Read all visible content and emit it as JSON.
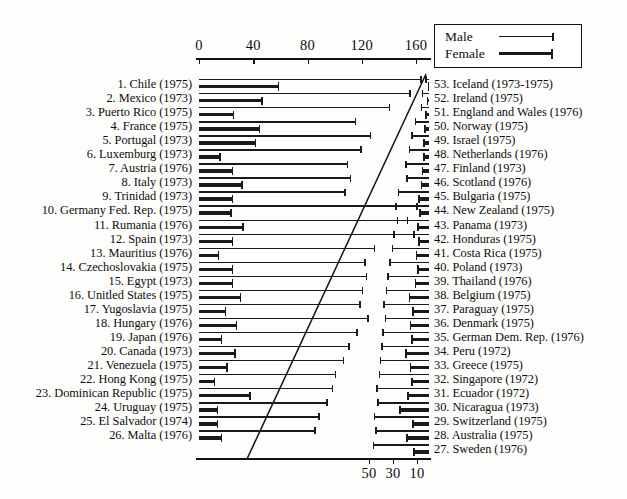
{
  "legend": {
    "male_label": "Male",
    "female_label": "Female"
  },
  "axes": {
    "top": {
      "ticks": [
        "0",
        "40",
        "80",
        "120",
        "160"
      ],
      "values": [
        0,
        40,
        80,
        120,
        160
      ]
    },
    "bottom": {
      "ticks": [
        "50",
        "30",
        "10"
      ],
      "values": [
        50,
        30,
        10
      ],
      "reversed": true
    }
  },
  "chart_data": {
    "type": "bar",
    "title": "",
    "xlabel": "",
    "ylabel": "",
    "orientation": "horizontal",
    "series_names": [
      "Male",
      "Female"
    ],
    "top_axis_range": [
      0,
      170
    ],
    "bottom_axis_range": [
      0,
      55
    ],
    "left_panel": {
      "axis": "top",
      "rows": [
        {
          "rank": 1,
          "label": "1. Chile (1975)",
          "male": 163,
          "female": 58
        },
        {
          "rank": 2,
          "label": "2. Mexico (1973)",
          "male": 155,
          "female": 46
        },
        {
          "rank": 3,
          "label": "3. Puerto Rico (1975)",
          "male": 140,
          "female": 25
        },
        {
          "rank": 4,
          "label": "4. France (1975)",
          "male": 115,
          "female": 44
        },
        {
          "rank": 5,
          "label": "5. Portugal (1973)",
          "male": 126,
          "female": 41
        },
        {
          "rank": 6,
          "label": "6. Luxemburg (1973)",
          "male": 119,
          "female": 15
        },
        {
          "rank": 7,
          "label": "7. Austria (1976)",
          "male": 109,
          "female": 24
        },
        {
          "rank": 8,
          "label": "8. Italy (1973)",
          "male": 111,
          "female": 31
        },
        {
          "rank": 9,
          "label": "9. Trinidad (1973)",
          "male": 107,
          "female": 24
        },
        {
          "rank": 10,
          "label": "10. Germany Fed. Rep. (1975)",
          "male": 160,
          "female": 23
        },
        {
          "rank": 11,
          "label": "11. Rumania (1976)",
          "male": 153,
          "female": 32
        },
        {
          "rank": 12,
          "label": "12. Spain (1973)",
          "male": 158,
          "female": 24
        },
        {
          "rank": 13,
          "label": "13. Mauritius (1976)",
          "male": 129,
          "female": 14
        },
        {
          "rank": 14,
          "label": "14. Czechoslovakia (1975)",
          "male": 122,
          "female": 24
        },
        {
          "rank": 15,
          "label": "15. Egypt (1973)",
          "male": 123,
          "female": 24
        },
        {
          "rank": 16,
          "label": "16. Unitled States (1975)",
          "male": 120,
          "female": 30
        },
        {
          "rank": 17,
          "label": "17. Yugoslavia (1975)",
          "male": 118,
          "female": 19
        },
        {
          "rank": 18,
          "label": "18. Hungary (1976)",
          "male": 124,
          "female": 27
        },
        {
          "rank": 19,
          "label": "19. Japan (1976)",
          "male": 116,
          "female": 16
        },
        {
          "rank": 20,
          "label": "20. Canada (1973)",
          "male": 110,
          "female": 26
        },
        {
          "rank": 21,
          "label": "21. Venezuela (1975)",
          "male": 106,
          "female": 20
        },
        {
          "rank": 22,
          "label": "22. Hong Kong (1975)",
          "male": 100,
          "female": 11
        },
        {
          "rank": 23,
          "label": "23. Dominican Republic (1975)",
          "male": 98,
          "female": 37
        },
        {
          "rank": 24,
          "label": "24. Uruguay (1975)",
          "male": 94,
          "female": 13
        },
        {
          "rank": 25,
          "label": "25. El Salvador (1974)",
          "male": 88,
          "female": 13
        },
        {
          "rank": 26,
          "label": "26. Malta (1976)",
          "male": 85,
          "female": 16
        }
      ]
    },
    "right_panel": {
      "axis": "bottom",
      "rows": [
        {
          "rank": 53,
          "label": "53. Iceland (1973-1975)",
          "male": 3,
          "female": 1
        },
        {
          "rank": 52,
          "label": "52. Ireland (1975)",
          "male": 6,
          "female": 2
        },
        {
          "rank": 51,
          "label": "51. England and Wales (1976)",
          "male": 7,
          "female": 3
        },
        {
          "rank": 50,
          "label": "50. Norway (1975)",
          "male": 12,
          "female": 4
        },
        {
          "rank": 49,
          "label": "49. Israel (1975)",
          "male": 15,
          "female": 5
        },
        {
          "rank": 48,
          "label": "48. Netherlands (1976)",
          "male": 17,
          "female": 5
        },
        {
          "rank": 47,
          "label": "47. Finland (1973)",
          "male": 20,
          "female": 6
        },
        {
          "rank": 46,
          "label": "46. Scotland (1976)",
          "male": 19,
          "female": 7
        },
        {
          "rank": 45,
          "label": "45. Bulgaria (1975)",
          "male": 26,
          "female": 9
        },
        {
          "rank": 44,
          "label": "44. New Zealand (1975)",
          "male": 28,
          "female": 8
        },
        {
          "rank": 43,
          "label": "43. Panama (1973)",
          "male": 27,
          "female": 10
        },
        {
          "rank": 42,
          "label": "42. Honduras (1975)",
          "male": 30,
          "female": 9
        },
        {
          "rank": 41,
          "label": "41. Costa Rica (1975)",
          "male": 31,
          "female": 11
        },
        {
          "rank": 40,
          "label": "40. Poland (1973)",
          "male": 33,
          "female": 10
        },
        {
          "rank": 39,
          "label": "39. Thailand (1976)",
          "male": 35,
          "female": 12
        },
        {
          "rank": 38,
          "label": "38. Belgium (1975)",
          "male": 36,
          "female": 17
        },
        {
          "rank": 37,
          "label": "37. Paraguay (1975)",
          "male": 38,
          "female": 14
        },
        {
          "rank": 36,
          "label": "36. Denmark (1975)",
          "male": 37,
          "female": 16
        },
        {
          "rank": 35,
          "label": "35. German Dem. Rep. (1976)",
          "male": 39,
          "female": 15
        },
        {
          "rank": 34,
          "label": "34. Peru (1972)",
          "male": 40,
          "female": 20
        },
        {
          "rank": 33,
          "label": "33. Greece (1975)",
          "male": 41,
          "female": 16
        },
        {
          "rank": 32,
          "label": "32. Singapore (1972)",
          "male": 42,
          "female": 15
        },
        {
          "rank": 31,
          "label": "31. Ecuador (1972)",
          "male": 44,
          "female": 18
        },
        {
          "rank": 30,
          "label": "30. Nicaragua (1973)",
          "male": 43,
          "female": 25
        },
        {
          "rank": 29,
          "label": "29. Switzerland (1975)",
          "male": 46,
          "female": 14
        },
        {
          "rank": 28,
          "label": "28. Australia (1975)",
          "male": 45,
          "female": 19
        },
        {
          "rank": 27,
          "label": "27. Sweden (1976)",
          "male": 47,
          "female": 13
        }
      ]
    }
  }
}
